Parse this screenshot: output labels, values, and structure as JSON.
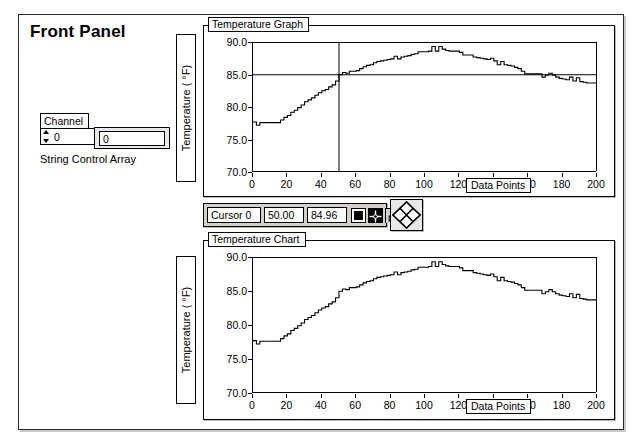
{
  "panel": {
    "title": "Front Panel"
  },
  "channel": {
    "caption": "Channel",
    "index_value": "0",
    "element_value": "0",
    "array_label": "String Control Array",
    "spinner_up_icon": "increment-arrow-icon",
    "spinner_down_icon": "decrement-arrow-icon"
  },
  "graph": {
    "title": "Temperature Graph",
    "y_caption": "Temperature ( °F)",
    "x_caption": "Data Points"
  },
  "chart": {
    "title": "Temperature Chart",
    "y_caption": "Temperature ( °F)",
    "x_caption": "Data Points"
  },
  "cursor_legend": {
    "name": "Cursor 0",
    "x_value": "50.00",
    "y_value": "84.96",
    "style_button_icon": "cursor-style-square-icon",
    "move_button_icon": "cursor-crosshair-icon",
    "lock_button_icon": "cursor-lock-icon",
    "pad_icon": "cursor-move-diamond-pad-icon"
  },
  "colors": {
    "plot_line": "#000000",
    "cursor_line": "#000000",
    "panel_border": "#2a2a2a",
    "legend_background": "#d4d0c8"
  },
  "chart_data": {
    "type": "line",
    "title": "Temperature Graph",
    "xlabel": "Data Points",
    "ylabel": "Temperature ( °F)",
    "xlim": [
      0,
      200
    ],
    "ylim": [
      70.0,
      90.0
    ],
    "xticks": [
      0,
      20,
      40,
      60,
      80,
      100,
      120,
      140,
      160,
      180,
      200
    ],
    "yticks": [
      70.0,
      75.0,
      80.0,
      85.0,
      90.0
    ],
    "grid": false,
    "legend": "none",
    "cursor": {
      "label": "Cursor 0",
      "x": 50.0,
      "y": 84.96
    },
    "x": [
      0,
      2,
      4,
      6,
      8,
      10,
      12,
      14,
      16,
      18,
      20,
      22,
      24,
      26,
      28,
      30,
      32,
      34,
      36,
      38,
      40,
      42,
      44,
      46,
      48,
      50,
      52,
      54,
      56,
      58,
      60,
      62,
      64,
      66,
      68,
      70,
      72,
      74,
      76,
      78,
      80,
      82,
      84,
      86,
      88,
      90,
      92,
      94,
      96,
      98,
      100,
      102,
      104,
      106,
      108,
      110,
      112,
      114,
      116,
      118,
      120,
      122,
      124,
      126,
      128,
      130,
      132,
      134,
      136,
      138,
      140,
      142,
      144,
      146,
      148,
      150,
      152,
      154,
      156,
      158,
      160,
      162,
      164,
      166,
      168,
      170,
      172,
      174,
      176,
      178,
      180,
      182,
      184,
      186,
      188,
      190,
      192,
      194,
      196,
      198,
      200
    ],
    "y": [
      77.7,
      77.2,
      77.6,
      77.6,
      77.6,
      77.6,
      77.6,
      77.6,
      78.0,
      78.4,
      78.7,
      79.2,
      79.5,
      79.9,
      80.3,
      80.8,
      81.1,
      81.4,
      81.8,
      82.2,
      82.5,
      82.7,
      83.1,
      83.4,
      84.0,
      84.96,
      85.3,
      85.2,
      85.5,
      85.5,
      85.6,
      85.9,
      86.2,
      86.4,
      86.5,
      86.8,
      87.0,
      87.1,
      87.2,
      87.3,
      87.4,
      87.8,
      87.4,
      87.7,
      87.8,
      87.9,
      88.1,
      88.2,
      88.5,
      88.5,
      88.5,
      88.6,
      89.3,
      88.6,
      89.3,
      88.9,
      88.7,
      88.6,
      88.6,
      88.6,
      88.4,
      88.0,
      88.0,
      88.0,
      87.7,
      87.6,
      87.5,
      87.4,
      87.3,
      87.5,
      87.1,
      86.5,
      87.0,
      86.5,
      86.4,
      86.3,
      86.1,
      85.9,
      85.5,
      85.1,
      85.1,
      85.1,
      85.1,
      85.1,
      84.6,
      84.9,
      85.2,
      84.9,
      84.6,
      84.4,
      84.3,
      84.2,
      84.6,
      84.0,
      84.5,
      83.9,
      83.8,
      83.7,
      83.7,
      83.7,
      83.7
    ],
    "series": [
      {
        "name": "Temperature Chart",
        "title": "Temperature Chart",
        "xlabel": "Data Points",
        "ylabel": "Temperature ( °F)",
        "xlim": [
          0,
          200
        ],
        "ylim": [
          70.0,
          90.0
        ],
        "x": [
          0,
          2,
          4,
          6,
          8,
          10,
          12,
          14,
          16,
          18,
          20,
          22,
          24,
          26,
          28,
          30,
          32,
          34,
          36,
          38,
          40,
          42,
          44,
          46,
          48,
          50,
          52,
          54,
          56,
          58,
          60,
          62,
          64,
          66,
          68,
          70,
          72,
          74,
          76,
          78,
          80,
          82,
          84,
          86,
          88,
          90,
          92,
          94,
          96,
          98,
          100,
          102,
          104,
          106,
          108,
          110,
          112,
          114,
          116,
          118,
          120,
          122,
          124,
          126,
          128,
          130,
          132,
          134,
          136,
          138,
          140,
          142,
          144,
          146,
          148,
          150,
          152,
          154,
          156,
          158,
          160,
          162,
          164,
          166,
          168,
          170,
          172,
          174,
          176,
          178,
          180,
          182,
          184,
          186,
          188,
          190,
          192,
          194,
          196,
          198,
          200
        ],
        "values": [
          77.7,
          77.2,
          77.6,
          77.6,
          77.6,
          77.6,
          77.6,
          77.6,
          78.0,
          78.4,
          78.7,
          79.2,
          79.5,
          79.9,
          80.3,
          80.8,
          81.1,
          81.4,
          81.8,
          82.2,
          82.5,
          82.7,
          83.1,
          83.4,
          84.0,
          84.96,
          85.3,
          85.2,
          85.5,
          85.5,
          85.6,
          85.9,
          86.2,
          86.4,
          86.5,
          86.8,
          87.0,
          87.1,
          87.2,
          87.3,
          87.4,
          87.8,
          87.4,
          87.7,
          87.8,
          87.9,
          88.1,
          88.2,
          88.5,
          88.5,
          88.5,
          88.6,
          89.3,
          88.6,
          89.3,
          88.9,
          88.7,
          88.6,
          88.6,
          88.6,
          88.4,
          88.0,
          88.0,
          88.0,
          87.7,
          87.6,
          87.5,
          87.4,
          87.3,
          87.5,
          87.1,
          86.5,
          87.0,
          86.5,
          86.4,
          86.3,
          86.1,
          85.9,
          85.5,
          85.1,
          85.1,
          85.1,
          85.1,
          85.1,
          84.6,
          84.9,
          85.2,
          84.9,
          84.6,
          84.4,
          84.3,
          84.2,
          84.6,
          84.0,
          84.5,
          83.9,
          83.8,
          83.7,
          83.7,
          83.7,
          83.7
        ]
      }
    ]
  }
}
